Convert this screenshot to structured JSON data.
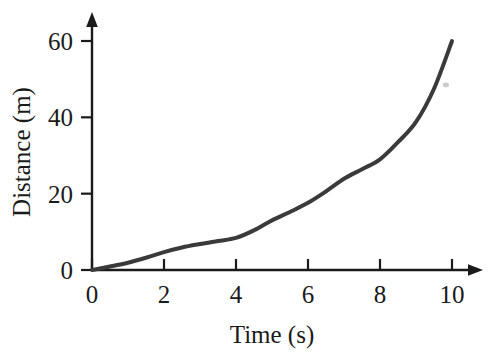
{
  "chart_data": {
    "type": "line",
    "title": "",
    "xlabel": "Time (s)",
    "ylabel": "Distance (m)",
    "xlim": [
      0,
      10.8
    ],
    "ylim": [
      0,
      64
    ],
    "xticks": [
      0,
      2,
      4,
      6,
      8,
      10
    ],
    "xticklabels": [
      "0",
      "2",
      "4",
      "6",
      "8",
      "10"
    ],
    "yticks": [
      0,
      20,
      40,
      60
    ],
    "yticklabels": [
      "0",
      "20",
      "40",
      "60"
    ],
    "grid": false,
    "legend": null,
    "axis_style": "arrow-tipped",
    "series": [
      {
        "name": "distance",
        "color": "#3a3a3a",
        "linewidth": 4,
        "x": [
          0,
          0.5,
          1,
          1.5,
          2,
          2.5,
          3,
          3.5,
          4,
          4.5,
          5,
          5.5,
          6,
          6.5,
          7,
          7.5,
          8,
          8.5,
          9,
          9.5,
          10
        ],
        "values": [
          0,
          0.9,
          1.9,
          3.2,
          4.7,
          5.9,
          6.8,
          7.6,
          8.4,
          10.4,
          13.0,
          15.2,
          17.6,
          20.6,
          23.9,
          26.4,
          29.0,
          33.5,
          38.8,
          47.5,
          60.0
        ]
      }
    ],
    "annotations": [
      {
        "name": "stray-mark",
        "x": 9.83,
        "y": 48.5,
        "color": "#b9b9b9",
        "shape": "speck"
      }
    ]
  },
  "axis_labels": {
    "x_title": "Time (s)",
    "y_title": "Distance (m)"
  },
  "colors": {
    "curve": "#3a3a3a",
    "axis": "#1a1a1a",
    "text": "#1a1a1a",
    "background": "#ffffff",
    "speck": "#b9b9b9"
  }
}
